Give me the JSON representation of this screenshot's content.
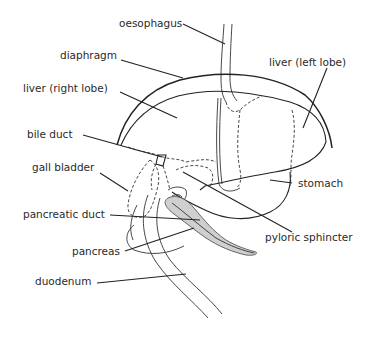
{
  "diagram": {
    "title": "",
    "type": "anatomical line drawing",
    "labels": [
      {
        "id": "oesophagus",
        "text": "oesophagus",
        "side": "top"
      },
      {
        "id": "diaphragm",
        "text": "diaphragm",
        "side": "left"
      },
      {
        "id": "liver-right-lobe",
        "text": "liver (right lobe)",
        "side": "left"
      },
      {
        "id": "liver-left-lobe",
        "text": "liver (left lobe)",
        "side": "right"
      },
      {
        "id": "bile-duct",
        "text": "bile duct",
        "side": "left"
      },
      {
        "id": "gall-bladder",
        "text": "gall bladder",
        "side": "left"
      },
      {
        "id": "stomach",
        "text": "stomach",
        "side": "right"
      },
      {
        "id": "pancreatic-duct",
        "text": "pancreatic duct",
        "side": "left"
      },
      {
        "id": "pyloric-sphincter",
        "text": "pyloric sphincter",
        "side": "right"
      },
      {
        "id": "pancreas",
        "text": "pancreas",
        "side": "left"
      },
      {
        "id": "duodenum",
        "text": "duodenum",
        "side": "left"
      }
    ],
    "colors": {
      "line": "#222222",
      "text": "#2a2a2a",
      "pancreas_fill": "#cfcfcf",
      "background": "#ffffff"
    }
  }
}
